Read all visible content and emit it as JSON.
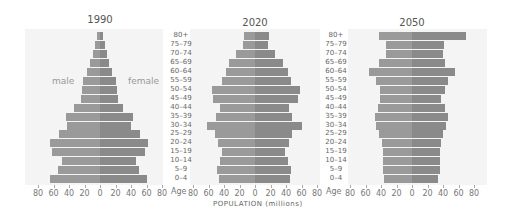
{
  "chart_data": {
    "type": "bar",
    "subtype": "population-pyramid",
    "xlabel": "POPULATION (millions)",
    "age_axis_label": "Age",
    "sex_labels": {
      "male": "male",
      "female": "female"
    },
    "x_ticks": [
      "80",
      "60",
      "40",
      "20",
      "0",
      "20",
      "40",
      "60",
      "80"
    ],
    "xlim": [
      -80,
      80
    ],
    "age_groups": [
      "0–4",
      "5–9",
      "10–14",
      "15–19",
      "20–24",
      "25–29",
      "30–34",
      "35–39",
      "40–44",
      "45–49",
      "50–54",
      "55–59",
      "60–64",
      "65–69",
      "70–74",
      "75–79",
      "80+"
    ],
    "panels": [
      {
        "title": "1990",
        "male": [
          65,
          54,
          49,
          62,
          65,
          53,
          43,
          44,
          33,
          25,
          23,
          22,
          17,
          13,
          9,
          6,
          4
        ],
        "female": [
          60,
          50,
          46,
          58,
          62,
          51,
          40,
          42,
          30,
          23,
          22,
          20,
          16,
          12,
          9,
          6,
          4
        ]
      },
      {
        "title": "2020",
        "male": [
          46,
          49,
          45,
          43,
          48,
          52,
          62,
          50,
          45,
          54,
          56,
          43,
          38,
          33,
          24,
          15,
          14
        ],
        "female": [
          45,
          47,
          42,
          39,
          44,
          48,
          60,
          48,
          44,
          55,
          58,
          47,
          42,
          36,
          26,
          17,
          18
        ]
      },
      {
        "title": "2050",
        "male": [
          36,
          38,
          38,
          38,
          39,
          42,
          46,
          48,
          44,
          41,
          41,
          47,
          55,
          43,
          33,
          33,
          42
        ],
        "female": [
          34,
          36,
          36,
          36,
          37,
          40,
          44,
          46,
          42,
          38,
          43,
          46,
          55,
          42,
          40,
          41,
          70
        ]
      }
    ],
    "colors": {
      "male": "#9a9a9a",
      "female": "#8a8a8a",
      "background": "#f4f4f4"
    },
    "grid": true,
    "legend": "inline text labels 'male' and 'female' on 1990 panel"
  },
  "labels": {
    "titles": [
      "1990",
      "2020",
      "2050"
    ],
    "male": "male",
    "female": "female",
    "age": "Age",
    "xlabel": "POPULATION (millions)"
  }
}
